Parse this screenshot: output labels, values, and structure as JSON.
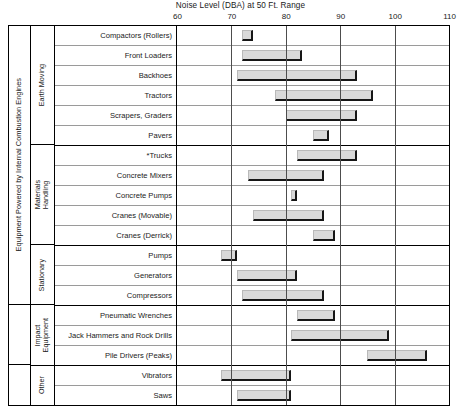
{
  "chart_data": {
    "type": "bar",
    "orientation": "horizontal",
    "subtype": "range-bar",
    "title": "Noise Level (DBA) at 50 Ft. Range",
    "xlabel": "Noise Level (DBA) at 50 Ft. Range",
    "ylabel": "",
    "xlim": [
      60,
      110
    ],
    "xticks": [
      60,
      70,
      80,
      90,
      100,
      110
    ],
    "tick_labels": [
      "60",
      "70",
      "80",
      "90",
      "100",
      "110"
    ],
    "grid": true,
    "legend": "none",
    "bar_color": "#d9d9d9",
    "categories": [
      "Compactors (Rollers)",
      "Front Loaders",
      "Backhoes",
      "Tractors",
      "Scrapers, Graders",
      "Pavers",
      "*Trucks",
      "Concrete Mixers",
      "Concrete Pumps",
      "Cranes (Movable)",
      "Cranes (Derrick)",
      "Pumps",
      "Generators",
      "Compressors",
      "Pneumatic Wrenches",
      "Jack Hammers and Rock Drills",
      "Pile Drivers (Peaks)",
      "Vibrators",
      "Saws"
    ],
    "ranges": [
      [
        72,
        74
      ],
      [
        72,
        83
      ],
      [
        71,
        93
      ],
      [
        78,
        96
      ],
      [
        80,
        93
      ],
      [
        85,
        88
      ],
      [
        82,
        93
      ],
      [
        73,
        87
      ],
      [
        81,
        82
      ],
      [
        74,
        87
      ],
      [
        85,
        89
      ],
      [
        68,
        71
      ],
      [
        71,
        82
      ],
      [
        72,
        87
      ],
      [
        82,
        89
      ],
      [
        81,
        99
      ],
      [
        95,
        106
      ],
      [
        68,
        81
      ],
      [
        71,
        81
      ]
    ]
  },
  "groups": [
    {
      "label": "Earth Moving",
      "rows": 6
    },
    {
      "label": "Materials\nHandling",
      "rows": 5
    },
    {
      "label": "Stationary",
      "rows": 3
    },
    {
      "label": "Impact\nEquipment",
      "rows": 3
    },
    {
      "label": "Other",
      "rows": 2
    }
  ],
  "mega_groups": [
    {
      "label": "Equipment Powered by Internal Combustion Engines",
      "rows": 14
    },
    {
      "label": "",
      "rows": 3
    },
    {
      "label": "",
      "rows": 2
    }
  ]
}
